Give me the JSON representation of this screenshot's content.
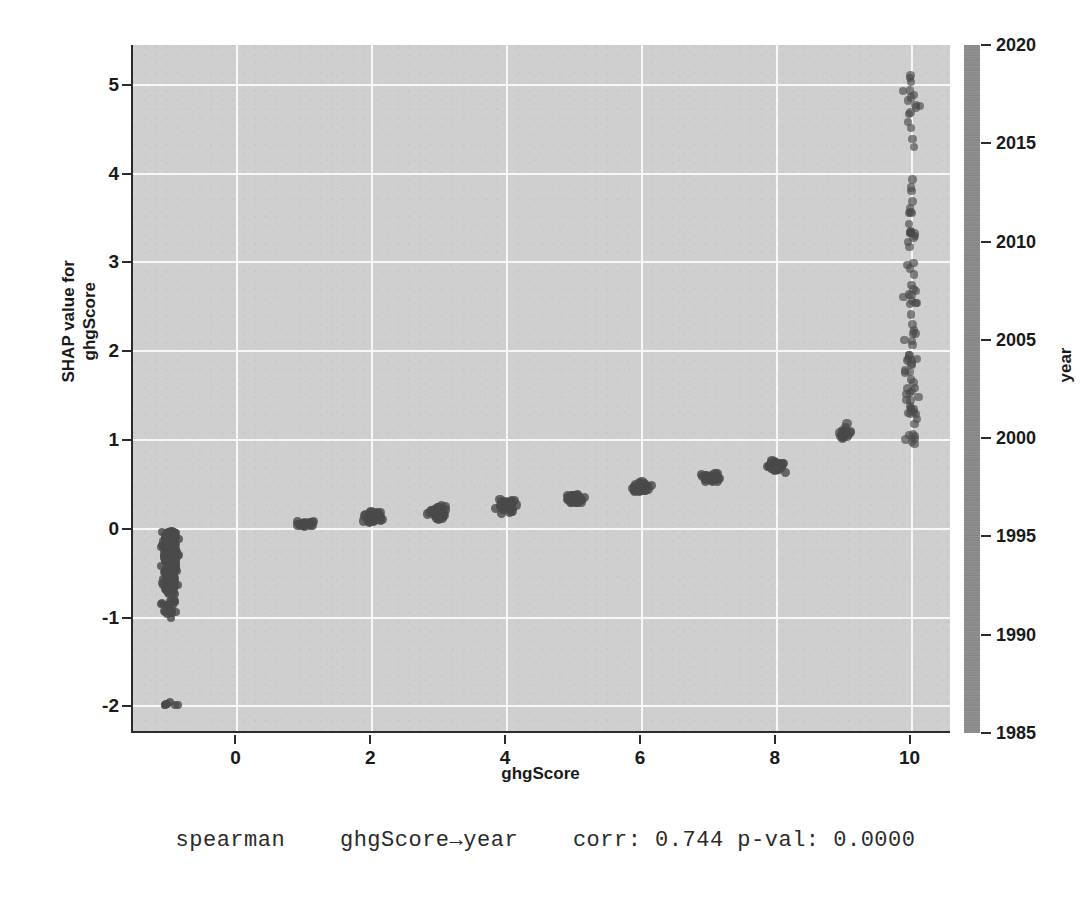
{
  "chart_data": {
    "type": "scatter",
    "title": "",
    "xlabel": "ghgScore",
    "ylabel": "SHAP value for ghgScore",
    "ylabel_line1": "SHAP value for",
    "ylabel_line2": "ghgScore",
    "xlim": [
      -1.55,
      10.6
    ],
    "ylim": [
      -2.3,
      5.45
    ],
    "xticks": [
      0,
      2,
      4,
      6,
      8,
      10
    ],
    "xticklabels": [
      "0",
      "2",
      "4",
      "6",
      "8",
      "10"
    ],
    "yticks": [
      -2,
      -1,
      0,
      1,
      2,
      3,
      4,
      5
    ],
    "yticklabels": [
      "-2",
      "-1",
      "0",
      "1",
      "2",
      "3",
      "4",
      "5"
    ],
    "grid": true,
    "grid_color": "#f7f7f7",
    "panel_color": "#cfcfcf",
    "point_color": "#4a4a4a",
    "colorbar": {
      "label": "year",
      "vmin": 1985,
      "vmax": 2020,
      "ticks": [
        1985,
        1990,
        1995,
        2000,
        2005,
        2010,
        2015,
        2020
      ],
      "ticklabels": [
        "1985",
        "1990",
        "1995",
        "2000",
        "2005",
        "2010",
        "2015",
        "2020"
      ],
      "colormap": "grayscale"
    },
    "series": [
      {
        "name": "SHAP values by ghgScore",
        "group_summary": [
          {
            "ghgScore": -1,
            "n": 420,
            "center": -0.35,
            "spread": 0.35,
            "min": -1.97,
            "max": 0.02
          },
          {
            "ghgScore": 1,
            "n": 22,
            "center": 0.05,
            "spread": 0.04,
            "min": -0.02,
            "max": 0.12
          },
          {
            "ghgScore": 2,
            "n": 40,
            "center": 0.13,
            "spread": 0.09,
            "min": -0.08,
            "max": 0.29
          },
          {
            "ghgScore": 3,
            "n": 42,
            "center": 0.19,
            "spread": 0.1,
            "min": -0.06,
            "max": 0.34
          },
          {
            "ghgScore": 4,
            "n": 44,
            "center": 0.26,
            "spread": 0.09,
            "min": 0.06,
            "max": 0.4
          },
          {
            "ghgScore": 5,
            "n": 40,
            "center": 0.33,
            "spread": 0.07,
            "min": 0.2,
            "max": 0.46
          },
          {
            "ghgScore": 6,
            "n": 40,
            "center": 0.47,
            "spread": 0.08,
            "min": 0.3,
            "max": 0.61
          },
          {
            "ghgScore": 7,
            "n": 36,
            "center": 0.57,
            "spread": 0.07,
            "min": 0.44,
            "max": 0.7
          },
          {
            "ghgScore": 8,
            "n": 40,
            "center": 0.7,
            "spread": 0.09,
            "min": 0.54,
            "max": 0.92
          },
          {
            "ghgScore": 9,
            "n": 16,
            "center": 1.06,
            "spread": 0.13,
            "min": 0.88,
            "max": 1.33
          },
          {
            "ghgScore": 10,
            "n": 96,
            "center": 2.3,
            "spread": 1.2,
            "min": 0.95,
            "max": 5.11
          }
        ]
      }
    ],
    "annotation": {
      "method": "spearman",
      "relation": "ghgScore→year",
      "corr_label": "corr:",
      "corr": "0.744",
      "pval_label": "p-val:",
      "pval": "0.0000",
      "full_text": "spearman    ghgScore→year    corr: 0.744 p-val: 0.0000"
    }
  }
}
